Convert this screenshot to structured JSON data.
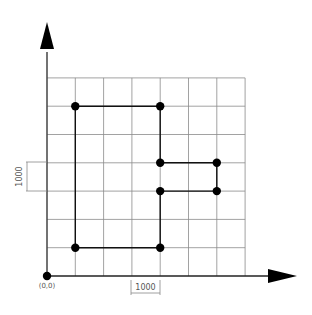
{
  "diagram": {
    "origin_label": "(0,0)",
    "x_dimension_label": "1000",
    "y_dimension_label": "1000",
    "grid": {
      "columns": 7,
      "rows": 7,
      "unit": 1000,
      "origin_px": [
        47,
        276
      ],
      "spacing_px": 28.3
    },
    "colors": {
      "grid": "#8a8a8a",
      "axis": "#222222",
      "path": "#111111",
      "point": "#000000",
      "dimension": "#888888"
    },
    "points": [
      {
        "x": 0,
        "y": 0
      },
      {
        "x": 1000,
        "y": 6000
      },
      {
        "x": 4000,
        "y": 6000
      },
      {
        "x": 4000,
        "y": 4000
      },
      {
        "x": 6000,
        "y": 4000
      },
      {
        "x": 6000,
        "y": 3000
      },
      {
        "x": 4000,
        "y": 3000
      },
      {
        "x": 4000,
        "y": 1000
      },
      {
        "x": 1000,
        "y": 1000
      }
    ],
    "path": [
      [
        1000,
        1000
      ],
      [
        1000,
        6000
      ],
      [
        4000,
        6000
      ],
      [
        4000,
        4000
      ],
      [
        6000,
        4000
      ],
      [
        6000,
        3000
      ],
      [
        4000,
        3000
      ],
      [
        4000,
        1000
      ],
      [
        1000,
        1000
      ]
    ]
  }
}
